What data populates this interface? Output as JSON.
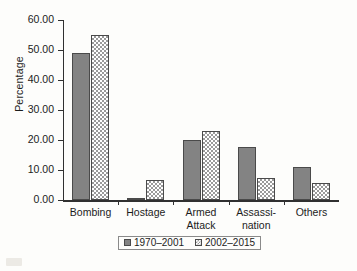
{
  "chart_data": {
    "type": "bar",
    "title": "",
    "xlabel": "",
    "ylabel": "Percentage",
    "ylim": [
      0,
      60
    ],
    "ytick_labels": [
      "0.00",
      "10.00",
      "20.00",
      "30.00",
      "40.00",
      "50.00",
      "60.00"
    ],
    "ytick_values": [
      0,
      10,
      20,
      30,
      40,
      50,
      60
    ],
    "grid": false,
    "legend_position": "bottom",
    "categories": [
      "Bombing",
      "Hostage",
      "Armed\nAttack",
      "Assassi-\nnation",
      "Others"
    ],
    "series": [
      {
        "name": "1970–2001",
        "values": [
          49.0,
          0.4,
          20.0,
          17.7,
          11.0
        ],
        "color": "#838383",
        "pattern": "solid"
      },
      {
        "name": "2002–2015",
        "values": [
          55.0,
          6.8,
          23.0,
          7.3,
          5.7
        ],
        "color": "#9a9a9a",
        "pattern": "checkerboard"
      }
    ]
  },
  "colors": {
    "background": "#fdfdfb",
    "axis": "#303030",
    "text": "#1c1c1c",
    "series_a": "#838383",
    "series_b": "#9a9a9a"
  }
}
